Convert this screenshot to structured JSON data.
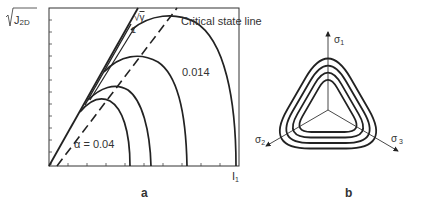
{
  "panel_a": {
    "y_axis_label": "√J2D",
    "x_axis_label": "I1",
    "slope_label_top": "√γ",
    "slope_label_bottom": "1",
    "critical_state_label": "Critical state line",
    "alpha_label": "α = 0.04",
    "curve_label": "0.014",
    "caption": "a",
    "yield_surfaces": [
      {
        "id": "alpha-0.04",
        "peak_x": 0.36,
        "end_x": 0.4
      },
      {
        "id": "surface-2",
        "peak_x": 0.42,
        "end_x": 0.52
      },
      {
        "id": "surface-3",
        "peak_x": 0.55,
        "end_x": 0.72
      },
      {
        "id": "alpha-0.014",
        "peak_x": 0.72,
        "end_x": 0.98
      }
    ]
  },
  "panel_b": {
    "axis_1": "σ1",
    "axis_2": "σ2",
    "axis_3": "σ3",
    "caption": "b",
    "contour_count": 4
  }
}
